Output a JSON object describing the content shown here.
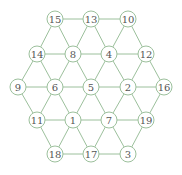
{
  "diagram": {
    "type": "hexagonal-grid-graph",
    "colors": {
      "line": "#9cc09c",
      "text": "#555555",
      "background": "#ffffff"
    },
    "node_radius": 8,
    "nodes": [
      {
        "id": "15",
        "label": "15",
        "x": 55,
        "y": 19
      },
      {
        "id": "13",
        "label": "13",
        "x": 91,
        "y": 19
      },
      {
        "id": "10",
        "label": "10",
        "x": 128,
        "y": 19
      },
      {
        "id": "14",
        "label": "14",
        "x": 37,
        "y": 54
      },
      {
        "id": "8",
        "label": "8",
        "x": 73,
        "y": 54
      },
      {
        "id": "4",
        "label": "4",
        "x": 109,
        "y": 54
      },
      {
        "id": "12",
        "label": "12",
        "x": 146,
        "y": 54
      },
      {
        "id": "9",
        "label": "9",
        "x": 18,
        "y": 87
      },
      {
        "id": "6",
        "label": "6",
        "x": 55,
        "y": 87
      },
      {
        "id": "5",
        "label": "5",
        "x": 91,
        "y": 87
      },
      {
        "id": "2",
        "label": "2",
        "x": 128,
        "y": 87
      },
      {
        "id": "16",
        "label": "16",
        "x": 164,
        "y": 87
      },
      {
        "id": "11",
        "label": "11",
        "x": 37,
        "y": 120
      },
      {
        "id": "1",
        "label": "1",
        "x": 73,
        "y": 120
      },
      {
        "id": "7",
        "label": "7",
        "x": 109,
        "y": 120
      },
      {
        "id": "19",
        "label": "19",
        "x": 146,
        "y": 120
      },
      {
        "id": "18",
        "label": "18",
        "x": 55,
        "y": 154
      },
      {
        "id": "17",
        "label": "17",
        "x": 91,
        "y": 154
      },
      {
        "id": "3",
        "label": "3",
        "x": 128,
        "y": 154
      }
    ],
    "edges": [
      [
        "15",
        "13"
      ],
      [
        "13",
        "10"
      ],
      [
        "14",
        "8"
      ],
      [
        "8",
        "4"
      ],
      [
        "4",
        "12"
      ],
      [
        "9",
        "6"
      ],
      [
        "6",
        "5"
      ],
      [
        "5",
        "2"
      ],
      [
        "2",
        "16"
      ],
      [
        "11",
        "1"
      ],
      [
        "1",
        "7"
      ],
      [
        "7",
        "19"
      ],
      [
        "18",
        "17"
      ],
      [
        "17",
        "3"
      ],
      [
        "15",
        "14"
      ],
      [
        "15",
        "8"
      ],
      [
        "13",
        "8"
      ],
      [
        "13",
        "4"
      ],
      [
        "10",
        "4"
      ],
      [
        "10",
        "12"
      ],
      [
        "14",
        "9"
      ],
      [
        "14",
        "6"
      ],
      [
        "8",
        "6"
      ],
      [
        "8",
        "5"
      ],
      [
        "4",
        "5"
      ],
      [
        "4",
        "2"
      ],
      [
        "12",
        "2"
      ],
      [
        "12",
        "16"
      ],
      [
        "9",
        "11"
      ],
      [
        "6",
        "11"
      ],
      [
        "6",
        "1"
      ],
      [
        "5",
        "1"
      ],
      [
        "5",
        "7"
      ],
      [
        "2",
        "7"
      ],
      [
        "2",
        "19"
      ],
      [
        "16",
        "19"
      ],
      [
        "11",
        "18"
      ],
      [
        "1",
        "18"
      ],
      [
        "1",
        "17"
      ],
      [
        "7",
        "17"
      ],
      [
        "7",
        "3"
      ],
      [
        "19",
        "3"
      ]
    ]
  }
}
